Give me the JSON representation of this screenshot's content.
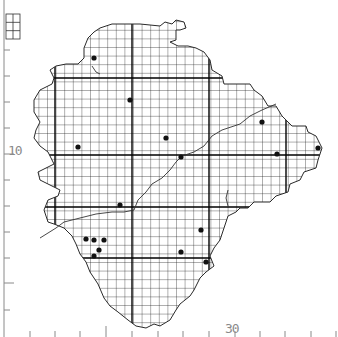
{
  "map": {
    "type": "grid-distribution-map",
    "grid_cell_px": 8.6,
    "colors": {
      "grid": "#1a1a1a",
      "outline": "#2a2a2a",
      "axis": "#8a8a8a",
      "dot": "#111111",
      "background": "#ffffff"
    },
    "axis_labels": {
      "left_major": "10",
      "bottom_major": "30"
    },
    "left_ticks_y": [
      50,
      76,
      102,
      128,
      154,
      180,
      206,
      232,
      258,
      283,
      310
    ],
    "left_major_ticks_y": [
      154,
      283
    ],
    "bottom_ticks_x": [
      30,
      55,
      80,
      106,
      132,
      158,
      183,
      209,
      235,
      260,
      285,
      311,
      336
    ],
    "bottom_major_ticks_x": [
      106
    ],
    "heavy_grid_x": [
      55,
      132,
      209,
      286
    ],
    "heavy_grid_y": [
      78,
      155,
      207,
      258
    ],
    "outline": [
      [
        100,
        28
      ],
      [
        112,
        24
      ],
      [
        140,
        24
      ],
      [
        160,
        26
      ],
      [
        165,
        22
      ],
      [
        172,
        24
      ],
      [
        176,
        20
      ],
      [
        184,
        22
      ],
      [
        186,
        28
      ],
      [
        180,
        30
      ],
      [
        176,
        30
      ],
      [
        176,
        40
      ],
      [
        170,
        42
      ],
      [
        178,
        46
      ],
      [
        188,
        46
      ],
      [
        196,
        48
      ],
      [
        204,
        52
      ],
      [
        210,
        60
      ],
      [
        212,
        70
      ],
      [
        222,
        76
      ],
      [
        224,
        84
      ],
      [
        238,
        84
      ],
      [
        250,
        84
      ],
      [
        254,
        90
      ],
      [
        262,
        96
      ],
      [
        268,
        106
      ],
      [
        276,
        106
      ],
      [
        282,
        116
      ],
      [
        288,
        122
      ],
      [
        292,
        126
      ],
      [
        306,
        126
      ],
      [
        308,
        132
      ],
      [
        316,
        136
      ],
      [
        322,
        148
      ],
      [
        318,
        160
      ],
      [
        316,
        168
      ],
      [
        304,
        172
      ],
      [
        300,
        180
      ],
      [
        290,
        184
      ],
      [
        288,
        192
      ],
      [
        276,
        196
      ],
      [
        270,
        202
      ],
      [
        254,
        202
      ],
      [
        248,
        208
      ],
      [
        240,
        208
      ],
      [
        236,
        212
      ],
      [
        228,
        216
      ],
      [
        224,
        228
      ],
      [
        220,
        240
      ],
      [
        214,
        248
      ],
      [
        210,
        256
      ],
      [
        214,
        266
      ],
      [
        206,
        272
      ],
      [
        200,
        278
      ],
      [
        194,
        290
      ],
      [
        190,
        296
      ],
      [
        180,
        304
      ],
      [
        176,
        310
      ],
      [
        170,
        320
      ],
      [
        160,
        326
      ],
      [
        154,
        324
      ],
      [
        146,
        328
      ],
      [
        136,
        326
      ],
      [
        128,
        320
      ],
      [
        118,
        312
      ],
      [
        110,
        306
      ],
      [
        104,
        298
      ],
      [
        98,
        284
      ],
      [
        90,
        272
      ],
      [
        86,
        262
      ],
      [
        80,
        254
      ],
      [
        76,
        244
      ],
      [
        72,
        236
      ],
      [
        64,
        228
      ],
      [
        54,
        224
      ],
      [
        48,
        222
      ],
      [
        44,
        210
      ],
      [
        48,
        200
      ],
      [
        58,
        196
      ],
      [
        60,
        190
      ],
      [
        52,
        186
      ],
      [
        40,
        180
      ],
      [
        38,
        172
      ],
      [
        46,
        168
      ],
      [
        54,
        164
      ],
      [
        48,
        152
      ],
      [
        40,
        146
      ],
      [
        34,
        138
      ],
      [
        36,
        130
      ],
      [
        40,
        122
      ],
      [
        34,
        112
      ],
      [
        34,
        100
      ],
      [
        40,
        90
      ],
      [
        52,
        84
      ],
      [
        54,
        78
      ],
      [
        50,
        70
      ],
      [
        56,
        66
      ],
      [
        66,
        64
      ],
      [
        78,
        64
      ],
      [
        84,
        58
      ],
      [
        84,
        48
      ],
      [
        88,
        38
      ],
      [
        94,
        32
      ]
    ],
    "inset_box": {
      "x": 6,
      "y": 14,
      "w": 14,
      "h": 25
    },
    "records": [
      {
        "x": 94,
        "y": 58
      },
      {
        "x": 130,
        "y": 100
      },
      {
        "x": 166,
        "y": 138
      },
      {
        "x": 181,
        "y": 157
      },
      {
        "x": 78,
        "y": 147
      },
      {
        "x": 262,
        "y": 122
      },
      {
        "x": 277,
        "y": 154
      },
      {
        "x": 318,
        "y": 148
      },
      {
        "x": 120,
        "y": 205
      },
      {
        "x": 201,
        "y": 230
      },
      {
        "x": 181,
        "y": 252
      },
      {
        "x": 206,
        "y": 262
      },
      {
        "x": 94,
        "y": 240
      },
      {
        "x": 104,
        "y": 240
      },
      {
        "x": 99,
        "y": 250
      },
      {
        "x": 94,
        "y": 256
      },
      {
        "x": 86,
        "y": 239
      }
    ],
    "rivers": [
      "M40,238 L56,228 L64,222 L80,218 L96,214 L112,212 L124,212 L134,210 L138,200 L146,192 L152,184 L162,178 L170,170 L176,162 L182,156 L194,152 L204,146 L212,136 L222,130 L240,124 L250,116 L262,110 L276,104",
      "M228,206 L226,198 L228,190",
      "M92,66 L96,72 L100,74"
    ]
  }
}
